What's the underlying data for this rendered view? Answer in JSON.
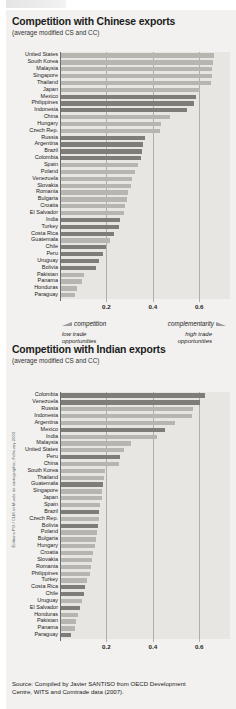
{
  "side_credit": "Éditions PO / CLM et Musée de cartographie, February 2009",
  "source": {
    "line1": "Source: Compiled by Javier SANTISO from OECD Development",
    "line2": "Centre, WITS and Comtrade data (2007)."
  },
  "colors": {
    "panel_bg": "#f2f1ef",
    "plot_bg": "#e7e6e3",
    "bar_light": "#b7b5b0",
    "bar_dark": "#7f7d78",
    "axis": "#6b6b6b",
    "grid": "#b0afac",
    "text": "#1a1a1a"
  },
  "chart_data": [
    {
      "type": "bar",
      "orientation": "horizontal",
      "title": "Competition with Chinese exports",
      "subtitle": "(average modified CS and CC)",
      "xlabel": "",
      "ylabel": "",
      "xlim": [
        0,
        0.68
      ],
      "grid": true,
      "ticks": [
        "0.2",
        "0.4",
        "0.6"
      ],
      "tick_values": [
        0.2,
        0.4,
        0.6
      ],
      "annotations": {
        "left_label": "competition",
        "right_label": "complementarity",
        "left_note_1": "low trade",
        "left_note_2": "opportunities",
        "right_note_1": "high trade",
        "right_note_2": "opportunities"
      },
      "categories": [
        "United States",
        "South Korea",
        "Malaysia",
        "Singapore",
        "Thailand",
        "Japan",
        "Mexico",
        "Philippines",
        "Indonesia",
        "China",
        "Hungary",
        "Czech Rep.",
        "Russia",
        "Argentina",
        "Brazil",
        "Colombia",
        "Spain",
        "Poland",
        "Venezuela",
        "Slovakia",
        "Romania",
        "Bulgaria",
        "Croatia",
        "El Salvador",
        "India",
        "Turkey",
        "Costa Rica",
        "Guatemala",
        "Chile",
        "Peru",
        "Uruguay",
        "Bolivia",
        "Pakistan",
        "Panama",
        "Honduras",
        "Paraguay"
      ],
      "values": [
        0.66,
        0.655,
        0.65,
        0.65,
        0.645,
        0.6,
        0.58,
        0.575,
        0.545,
        0.47,
        0.43,
        0.425,
        0.36,
        0.355,
        0.35,
        0.345,
        0.33,
        0.32,
        0.305,
        0.3,
        0.29,
        0.285,
        0.275,
        0.27,
        0.255,
        0.25,
        0.23,
        0.21,
        0.195,
        0.18,
        0.165,
        0.15,
        0.1,
        0.09,
        0.07,
        0.06
      ],
      "highlight": [
        false,
        false,
        false,
        false,
        false,
        false,
        true,
        true,
        true,
        false,
        false,
        false,
        true,
        true,
        true,
        true,
        false,
        false,
        false,
        false,
        false,
        false,
        false,
        false,
        true,
        true,
        true,
        false,
        true,
        true,
        true,
        true,
        false,
        false,
        false,
        false
      ]
    },
    {
      "type": "bar",
      "orientation": "horizontal",
      "title": "Competition with Indian exports",
      "subtitle": "(average modified CS and CC)",
      "xlabel": "",
      "ylabel": "",
      "xlim": [
        0,
        0.68
      ],
      "grid": true,
      "ticks": [
        "0.2",
        "0.4",
        "0.6"
      ],
      "tick_values": [
        0.2,
        0.4,
        0.6
      ],
      "categories": [
        "Colombia",
        "Venezuela",
        "Russia",
        "Indonesia",
        "Argentina",
        "Mexico",
        "India",
        "Malaysia",
        "United States",
        "Peru",
        "China",
        "South Korea",
        "Thailand",
        "Guatemala",
        "Singapore",
        "Japan",
        "Spain",
        "Brazil",
        "Czech Rep.",
        "Bolivia",
        "Poland",
        "Bulgaria",
        "Hungary",
        "Croatia",
        "Slovakia",
        "Romania",
        "Philippines",
        "Turkey",
        "Costa Rica",
        "Chile",
        "Uruguay",
        "El Salvador",
        "Honduras",
        "Pakistan",
        "Panama",
        "Paraguay"
      ],
      "values": [
        0.62,
        0.6,
        0.57,
        0.565,
        0.49,
        0.45,
        0.415,
        0.3,
        0.27,
        0.255,
        0.25,
        0.19,
        0.185,
        0.18,
        0.175,
        0.175,
        0.17,
        0.165,
        0.165,
        0.16,
        0.155,
        0.15,
        0.145,
        0.14,
        0.135,
        0.13,
        0.125,
        0.11,
        0.105,
        0.1,
        0.09,
        0.08,
        0.075,
        0.065,
        0.06,
        0.045
      ],
      "highlight": [
        true,
        true,
        false,
        false,
        false,
        true,
        false,
        false,
        false,
        true,
        false,
        false,
        false,
        true,
        false,
        false,
        false,
        true,
        false,
        true,
        false,
        false,
        false,
        false,
        false,
        false,
        false,
        false,
        true,
        true,
        false,
        true,
        false,
        false,
        false,
        true
      ]
    }
  ]
}
